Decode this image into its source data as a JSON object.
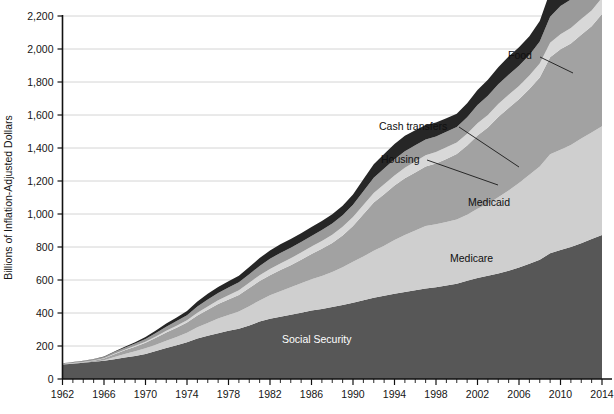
{
  "chart_data": {
    "type": "area",
    "title": "",
    "subtitle": "",
    "xlabel": "",
    "ylabel": "Billions of Inflation-Adjusted Dollars",
    "xlim": [
      1962,
      2014
    ],
    "ylim": [
      0,
      2200
    ],
    "grid": true,
    "legend_position": "inline-annotations",
    "stacked": true,
    "x_tick_labels": [
      "1962",
      "1966",
      "1970",
      "1974",
      "1978",
      "1982",
      "1986",
      "1990",
      "1994",
      "1998",
      "2002",
      "2006",
      "2010",
      "2014"
    ],
    "x_tick_values": [
      1962,
      1966,
      1970,
      1974,
      1978,
      1982,
      1986,
      1990,
      1994,
      1998,
      2002,
      2006,
      2010,
      2014
    ],
    "x_minor_tick_step": 1,
    "y_tick_labels": [
      "0",
      "200",
      "400",
      "600",
      "800",
      "1,000",
      "1,200",
      "1,400",
      "1,600",
      "1,800",
      "2,000",
      "2,200"
    ],
    "y_tick_values": [
      0,
      200,
      400,
      600,
      800,
      1000,
      1200,
      1400,
      1600,
      1800,
      2000,
      2200
    ],
    "x": [
      1962,
      1963,
      1964,
      1965,
      1966,
      1967,
      1968,
      1969,
      1970,
      1971,
      1972,
      1973,
      1974,
      1975,
      1976,
      1977,
      1978,
      1979,
      1980,
      1981,
      1982,
      1983,
      1984,
      1985,
      1986,
      1987,
      1988,
      1989,
      1990,
      1991,
      1992,
      1993,
      1994,
      1995,
      1996,
      1997,
      1998,
      1999,
      2000,
      2001,
      2002,
      2003,
      2004,
      2005,
      2006,
      2007,
      2008,
      2009,
      2010,
      2011,
      2012,
      2013,
      2014
    ],
    "series": [
      {
        "name": "Social Security",
        "color": "#575757",
        "label_color": "#ffffff",
        "values": [
          88,
          93,
          98,
          104,
          110,
          120,
          130,
          140,
          152,
          170,
          188,
          205,
          222,
          245,
          262,
          278,
          292,
          305,
          325,
          348,
          365,
          378,
          390,
          402,
          415,
          425,
          436,
          448,
          462,
          478,
          492,
          504,
          516,
          528,
          538,
          548,
          556,
          566,
          578,
          595,
          612,
          626,
          640,
          656,
          676,
          698,
          722,
          762,
          782,
          800,
          822,
          848,
          872
        ]
      },
      {
        "name": "Medicare",
        "color": "#cfcfcf",
        "label_color": "#101010",
        "values": [
          0,
          0,
          0,
          0,
          4,
          14,
          22,
          28,
          34,
          38,
          44,
          50,
          58,
          68,
          78,
          88,
          96,
          104,
          116,
          128,
          142,
          154,
          166,
          178,
          190,
          200,
          212,
          230,
          248,
          264,
          286,
          304,
          326,
          344,
          362,
          380,
          382,
          386,
          388,
          400,
          420,
          436,
          462,
          486,
          512,
          540,
          566,
          600,
          608,
          618,
          636,
          646,
          660
        ]
      },
      {
        "name": "Medicaid",
        "color": "#a2a2a2",
        "label_color": "#101010",
        "values": [
          2,
          3,
          4,
          6,
          10,
          16,
          22,
          28,
          34,
          42,
          50,
          56,
          62,
          72,
          80,
          88,
          94,
          100,
          110,
          118,
          122,
          128,
          134,
          142,
          152,
          164,
          176,
          192,
          218,
          256,
          292,
          312,
          330,
          344,
          352,
          360,
          368,
          382,
          398,
          420,
          444,
          462,
          486,
          500,
          508,
          520,
          540,
          588,
          608,
          616,
          628,
          644,
          680
        ]
      },
      {
        "name": "Housing",
        "color": "#d8d8d8",
        "label_color": "#101010",
        "values": [
          1,
          1,
          1,
          2,
          2,
          3,
          4,
          5,
          6,
          8,
          10,
          12,
          14,
          17,
          20,
          23,
          26,
          29,
          32,
          35,
          38,
          40,
          42,
          44,
          46,
          48,
          50,
          52,
          54,
          56,
          58,
          60,
          62,
          64,
          66,
          68,
          70,
          70,
          70,
          72,
          74,
          76,
          78,
          80,
          80,
          82,
          84,
          88,
          92,
          94,
          96,
          96,
          98
        ]
      },
      {
        "name": "Cash transfers",
        "color": "#9a9a9a",
        "label_color": "#101010",
        "values": [
          4,
          5,
          6,
          7,
          8,
          10,
          12,
          14,
          17,
          21,
          25,
          28,
          31,
          38,
          42,
          44,
          46,
          48,
          52,
          56,
          62,
          64,
          64,
          64,
          64,
          66,
          68,
          70,
          74,
          84,
          92,
          96,
          98,
          100,
          98,
          96,
          94,
          94,
          94,
          100,
          110,
          116,
          120,
          122,
          122,
          124,
          134,
          158,
          170,
          172,
          170,
          168,
          168
        ]
      },
      {
        "name": "Food",
        "color": "#262626",
        "label_color": "#101010",
        "values": [
          1,
          1,
          2,
          2,
          3,
          4,
          6,
          8,
          11,
          15,
          19,
          22,
          25,
          30,
          34,
          36,
          38,
          40,
          44,
          48,
          50,
          52,
          52,
          54,
          54,
          54,
          56,
          58,
          62,
          72,
          82,
          88,
          92,
          94,
          92,
          88,
          84,
          82,
          80,
          84,
          92,
          98,
          104,
          110,
          112,
          114,
          124,
          152,
          172,
          182,
          184,
          180,
          178
        ]
      }
    ],
    "annotations": [
      {
        "text": "Food",
        "placement": "outside-right-top"
      },
      {
        "text": "Cash transfers",
        "placement": "outside-right-mid"
      },
      {
        "text": "Housing",
        "placement": "outside-right-mid"
      },
      {
        "text": "Medicaid",
        "placement": "inside"
      },
      {
        "text": "Medicare",
        "placement": "inside"
      },
      {
        "text": "Social Security",
        "placement": "inside"
      }
    ]
  }
}
